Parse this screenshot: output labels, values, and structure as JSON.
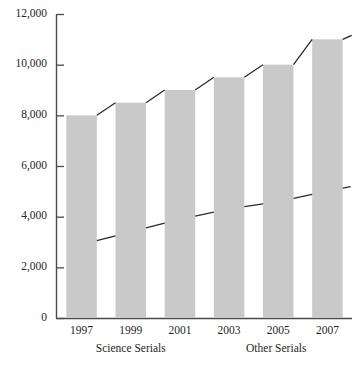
{
  "chart_data": {
    "type": "bar",
    "title": "",
    "subtitle": "",
    "xlabel": "",
    "ylabel": "",
    "grid": false,
    "legend_position": "none",
    "categories": [
      "1997",
      "1999",
      "2001",
      "2003",
      "2005",
      "2007"
    ],
    "ylim": [
      0,
      12000
    ],
    "yticks": [
      0,
      2000,
      4000,
      6000,
      8000,
      10000,
      12000
    ],
    "ytick_labels": [
      "0",
      "2,000",
      "4,000",
      "6,000",
      "8,000",
      "10,000",
      "12,000"
    ],
    "group_labels": [
      "Science Serials",
      "Other Serials"
    ],
    "series": [
      {
        "name": "Other Serials",
        "render": "bar",
        "values": [
          8000,
          8500,
          9000,
          9500,
          10000,
          11000
        ],
        "color": "#c9c9c9"
      },
      {
        "name": "Other Serials",
        "render": "line",
        "values": [
          8000,
          8500,
          9000,
          9500,
          10000,
          11000
        ],
        "color": "#2b2b2b"
      },
      {
        "name": "Science Serials",
        "render": "line",
        "values": [
          2900,
          3400,
          3900,
          4300,
          4600,
          5000
        ],
        "color": "#2b2b2b"
      }
    ]
  },
  "axis": {
    "x_axis_name": "year-axis",
    "y_axis_name": "count-axis"
  }
}
